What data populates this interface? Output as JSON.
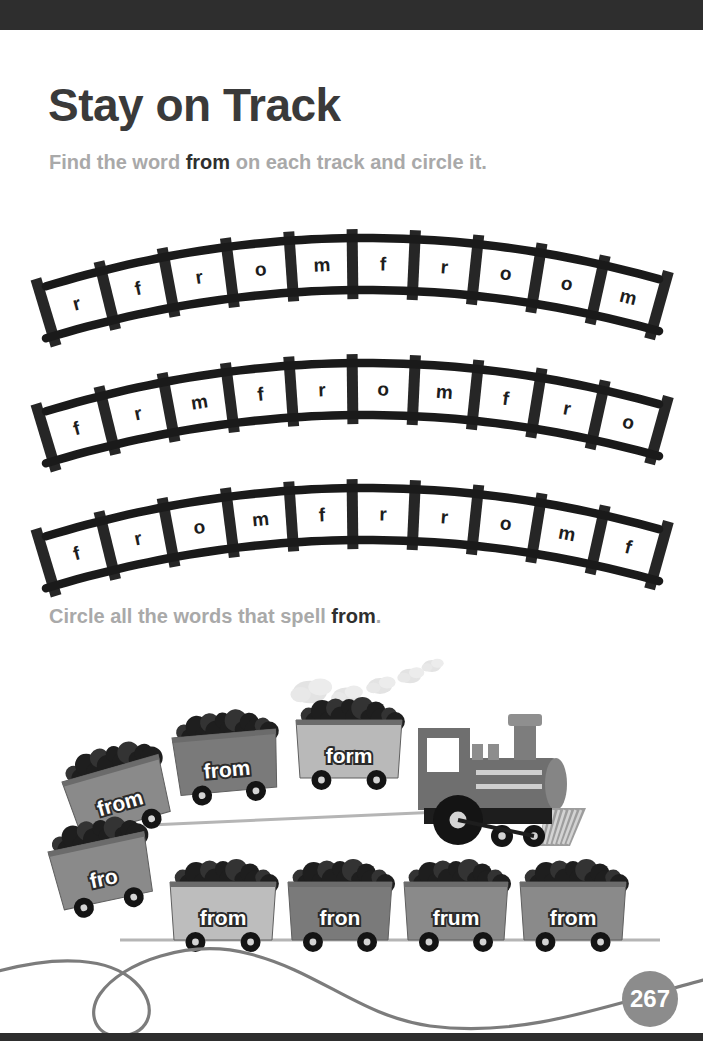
{
  "page": {
    "title": "Stay on Track",
    "page_number": "267",
    "band_color": "#2e2e2e",
    "muted_text_color": "#a9a9a9",
    "accent_text_color": "#2f2f2f"
  },
  "instructions": {
    "first": {
      "before": "Find the word ",
      "word": "from",
      "after": " on each track and circle it."
    },
    "second": {
      "before": "Circle all the words that spell ",
      "word": "from",
      "after": "."
    }
  },
  "tracks": [
    {
      "id": "track-1",
      "letters": [
        "r",
        "f",
        "r",
        "o",
        "m",
        "f",
        "r",
        "o",
        "o",
        "m"
      ]
    },
    {
      "id": "track-2",
      "letters": [
        "f",
        "r",
        "m",
        "f",
        "r",
        "o",
        "m",
        "f",
        "r",
        "o"
      ]
    },
    {
      "id": "track-3",
      "letters": [
        "f",
        "r",
        "o",
        "m",
        "f",
        "r",
        "r",
        "o",
        "m",
        "f"
      ]
    }
  ],
  "train": {
    "locomotive": {
      "name": "locomotive",
      "body_color": "#6f6f6f",
      "wheel_color": "#1d1d1d"
    },
    "smoke_puffs": 5,
    "upper_cars": [
      {
        "word": "from",
        "color": "#8a8a8a"
      },
      {
        "word": "from",
        "color": "#7a7a7a"
      },
      {
        "word": "form",
        "color": "#b9b9b9"
      }
    ],
    "lower_cars": [
      {
        "word": "fro",
        "color": "#8a8a8a"
      },
      {
        "word": "from",
        "color": "#bdbdbd"
      },
      {
        "word": "fron",
        "color": "#7a7a7a"
      },
      {
        "word": "frum",
        "color": "#8a8a8a"
      },
      {
        "word": "from",
        "color": "#8a8a8a"
      }
    ]
  }
}
